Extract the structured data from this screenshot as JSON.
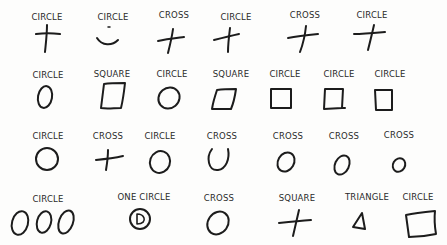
{
  "rows": [
    {
      "items": [
        {
          "label": "CIRCLE",
          "shape": "cross"
        },
        {
          "label": "CIRCLE",
          "shape": "smile"
        },
        {
          "label": "CROSS",
          "shape": "cross"
        },
        {
          "label": "CIRCLE",
          "shape": "cross"
        },
        {
          "label": "CROSS",
          "shape": "cross"
        },
        {
          "label": "CIRCLE",
          "shape": "cross"
        }
      ]
    },
    {
      "items": [
        {
          "label": "CIRCLE",
          "shape": "circle"
        },
        {
          "label": "SQUARE",
          "shape": "square"
        },
        {
          "label": "CIRCLE",
          "shape": "circle"
        },
        {
          "label": "SQUARE",
          "shape": "square"
        },
        {
          "label": "CIRCLE",
          "shape": "square"
        },
        {
          "label": "CIRCLE",
          "shape": "square"
        },
        {
          "label": "CIRCLE",
          "shape": "square"
        }
      ]
    },
    {
      "items": [
        {
          "label": "CIRCLE",
          "shape": "circle"
        },
        {
          "label": "CROSS",
          "shape": "cross"
        },
        {
          "label": "CIRCLE",
          "shape": "circle"
        },
        {
          "label": "CROSS",
          "shape": "u-shape"
        },
        {
          "label": "CROSS",
          "shape": "circle"
        },
        {
          "label": "CROSS",
          "shape": "circle"
        },
        {
          "label": "CROSS",
          "shape": "small-circle"
        }
      ]
    },
    {
      "items": [
        {
          "label": "CIRCLE",
          "shape": "three-circles"
        },
        {
          "label": "ONE CIRCLE",
          "shape": "nested-circle"
        },
        {
          "label": "CROSS",
          "shape": "circle"
        },
        {
          "label": "SQUARE",
          "shape": "cross"
        },
        {
          "label": "TRIANGLE",
          "shape": "triangle"
        },
        {
          "label": "CIRCLE",
          "shape": "square"
        }
      ]
    }
  ]
}
